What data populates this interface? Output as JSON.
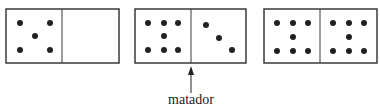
{
  "dominoes": [
    {
      "left": 5,
      "right": 0
    },
    {
      "left": 7,
      "right": 3
    },
    {
      "left": 7,
      "right": 7
    }
  ],
  "annotation": {
    "label": "matador",
    "points_to": "divider of second domino"
  },
  "colors": {
    "outline": "#3a3a3a",
    "pip": "#222222",
    "background": "#ffffff"
  }
}
